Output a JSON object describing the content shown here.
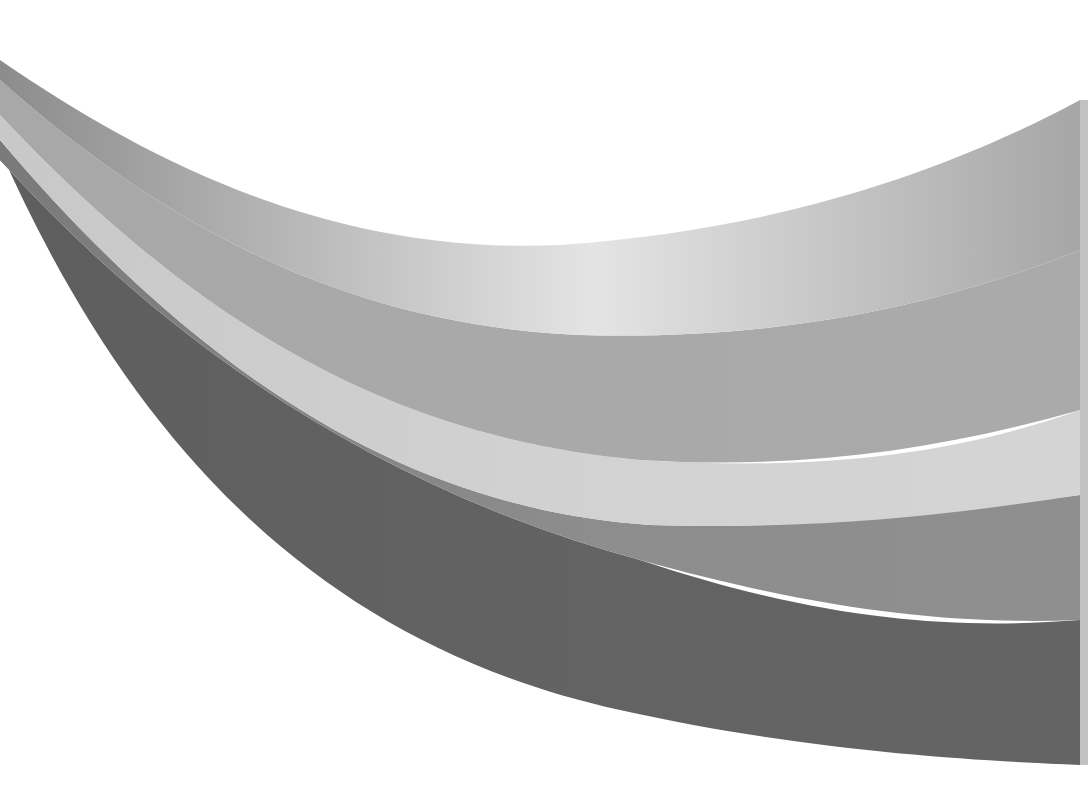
{
  "image": {
    "description": "Abstract graphic of five sweeping curved grayscale bands",
    "background": "#ffffff",
    "bands": [
      {
        "name": "band-top",
        "color_start": "#8c8c8c",
        "color_mid": "#e4e4e4",
        "color_end": "#a6a6a6"
      },
      {
        "name": "band-second",
        "color_start": "#a8a8a8",
        "color_mid": "#a9a9a9",
        "color_end": "#aaaaaa"
      },
      {
        "name": "band-light",
        "color_start": "#c8c8c8",
        "color_mid": "#d2d2d2",
        "color_end": "#d4d4d4"
      },
      {
        "name": "band-mid-dark",
        "color_start": "#7a7a7a",
        "color_mid": "#8d8d8d",
        "color_end": "#8f8f8f"
      },
      {
        "name": "band-darkest",
        "color_start": "#5e5e5e",
        "color_mid": "#636363",
        "color_end": "#646464"
      }
    ]
  }
}
